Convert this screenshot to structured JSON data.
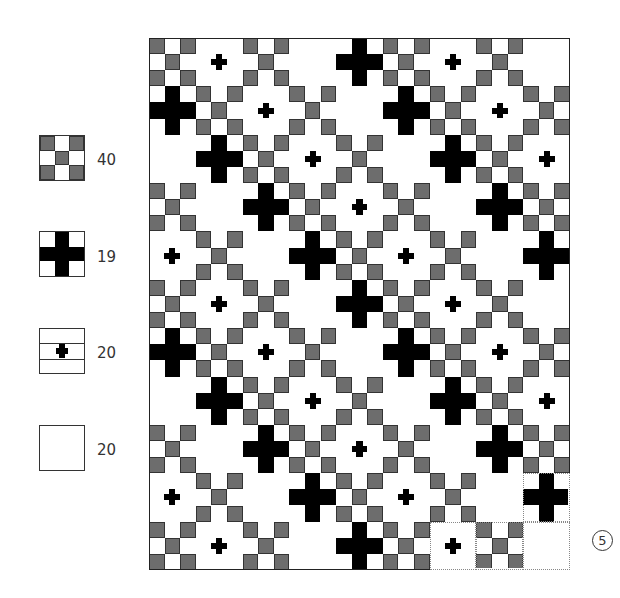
{
  "legend": [
    {
      "block": "nine-patch",
      "count": "40"
    },
    {
      "block": "big-cross",
      "count": "19"
    },
    {
      "block": "small-cross-banded",
      "count": "20"
    },
    {
      "block": "plain",
      "count": "20"
    }
  ],
  "quilt": {
    "columns": 9,
    "rows": 11,
    "diagonal_sequence": [
      "nine-patch",
      "small-cross",
      "nine-patch",
      "plain",
      "big-cross"
    ],
    "rule": "block(row,col) = diagonal_sequence[(col - row) mod 5]",
    "dashed_blocks": [
      [
        9,
        8
      ],
      [
        10,
        6
      ],
      [
        10,
        7
      ],
      [
        10,
        8
      ]
    ],
    "colors": {
      "gray": "#6d6d6d",
      "black": "#000000",
      "outline": "#222222",
      "dashed": "#888888"
    }
  },
  "page_number": "5"
}
